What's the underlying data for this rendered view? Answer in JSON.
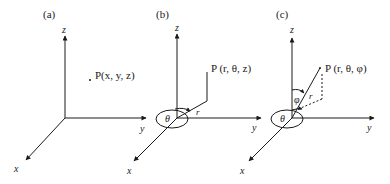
{
  "panels": [
    {
      "label": "(a)",
      "axes": {
        "x": "x",
        "y": "y",
        "z": "z"
      },
      "point_label": "P(x, y, z)",
      "system": "cartesian"
    },
    {
      "label": "(b)",
      "axes": {
        "x": "x",
        "y": "y",
        "z": "z"
      },
      "point_label": "P (r, θ, z)",
      "angle_label": "θ",
      "radius_label": "r",
      "system": "cylindrical"
    },
    {
      "label": "(c)",
      "axes": {
        "x": "x",
        "y": "y",
        "z": "z"
      },
      "point_label": "P (r, θ, φ)",
      "angle_label": "θ",
      "polar_angle_label": "φ",
      "radius_label": "r",
      "system": "spherical"
    }
  ],
  "colors": {
    "ink": "#1a1a1a",
    "background": "#ffffff"
  }
}
